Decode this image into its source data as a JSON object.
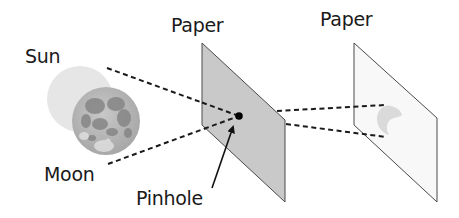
{
  "diagram": {
    "type": "pinhole-projection-solar-eclipse",
    "labels": {
      "sun": "Sun",
      "moon": "Moon",
      "paper_middle": "Paper",
      "paper_right": "Paper",
      "pinhole": "Pinhole"
    },
    "colors": {
      "sun": "#e4e4e4",
      "moon_base": "#b8b8b8",
      "moon_dark": "#8a8a8a",
      "paper_middle_fill": "#c9c9c9",
      "paper_right_fill": "#f7f7f7",
      "paper_stroke": "#4a4a4a",
      "dashed_line": "#1a1a1a",
      "pinhole": "#000000",
      "crescent_image": "#dcdcdc"
    },
    "nodes": [
      {
        "id": "sun",
        "shape": "circle",
        "label": "Sun"
      },
      {
        "id": "moon",
        "shape": "circle",
        "label": "Moon"
      },
      {
        "id": "paper_with_pinhole",
        "shape": "parallelogram",
        "label": "Paper"
      },
      {
        "id": "pinhole",
        "shape": "dot",
        "label": "Pinhole"
      },
      {
        "id": "projection_paper",
        "shape": "parallelogram",
        "label": "Paper"
      },
      {
        "id": "crescent_projection",
        "shape": "crescent"
      }
    ],
    "edges": [
      {
        "from": "sun",
        "to": "pinhole",
        "style": "dashed"
      },
      {
        "from": "moon",
        "to": "pinhole",
        "style": "dashed"
      },
      {
        "from": "pinhole",
        "to": "crescent_projection",
        "style": "dashed"
      },
      {
        "from": "pinhole",
        "to": "crescent_projection",
        "style": "dashed"
      },
      {
        "from": "pinhole_label",
        "to": "pinhole",
        "style": "arrow"
      }
    ]
  }
}
